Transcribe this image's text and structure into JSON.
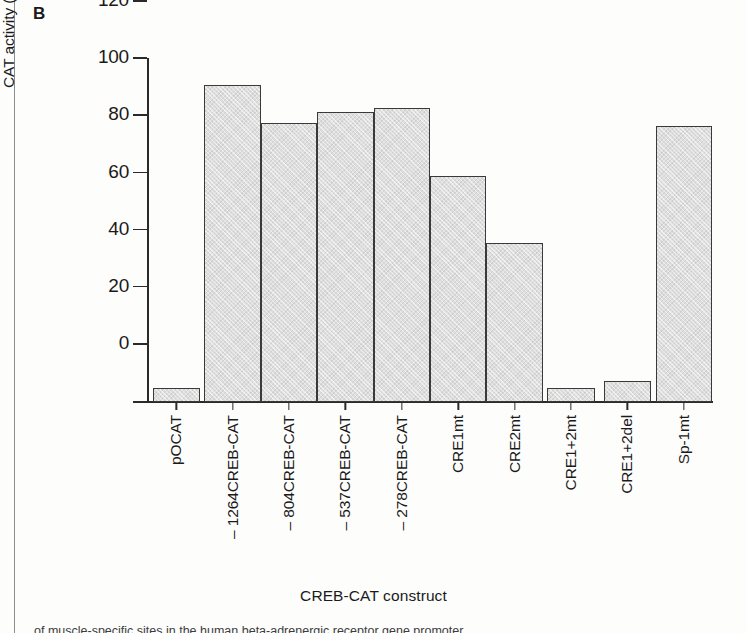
{
  "figure": {
    "panel_label": "B",
    "caption_fragment": "of muscle-specific sites in the human beta-adrenergic receptor gene promoter"
  },
  "chart_data": {
    "type": "bar",
    "title": "",
    "xlabel": "CREB-CAT construct",
    "ylabel": "Isoproterenol-induced increase in\nCAT activity (% change from control)",
    "categories": [
      "pOCAT",
      "– 1264CREB-CAT",
      "– 804CREB-CAT",
      "– 537CREB-CAT",
      "– 278CREB-CAT",
      "CRE1mt",
      "CRE2mt",
      "CRE1+2mt",
      "CRE1+2del",
      "Sp-1mt"
    ],
    "values": [
      5,
      111,
      97.5,
      101.5,
      103,
      79,
      55.5,
      5,
      7.5,
      96.5
    ],
    "ylim": [
      0,
      120
    ],
    "yticks": [
      0,
      20,
      40,
      60,
      80,
      100,
      120
    ],
    "ytick_labels": [
      "0",
      "20",
      "40",
      "60",
      "80",
      "100",
      "120"
    ],
    "grid": false,
    "legend": false,
    "bar_fill_color": "#dedede",
    "bar_edge_color": "#3a3a3a",
    "axis_color": "#2a2a2a",
    "background_color": "#fdfdfc"
  }
}
